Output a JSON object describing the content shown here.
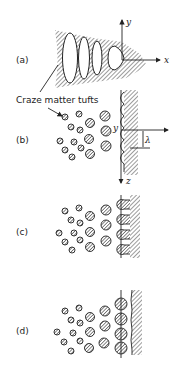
{
  "figure": {
    "panels": [
      {
        "id": "a",
        "label": "(a)"
      },
      {
        "id": "b",
        "label": "(b)"
      },
      {
        "id": "c",
        "label": "(c)"
      },
      {
        "id": "d",
        "label": "(d)"
      }
    ],
    "annotation": "Craze matter tufts",
    "axes": {
      "a_x": "x",
      "a_y": "y",
      "b_y": "y",
      "b_z": "z",
      "wavelength": "λ"
    }
  }
}
